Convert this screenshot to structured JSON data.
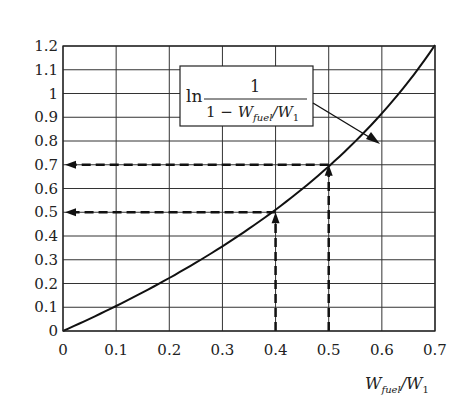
{
  "chart_data": {
    "type": "line",
    "title": "",
    "xlabel": "W_fuel/W_1",
    "xlabel_parts": {
      "main1": "W",
      "sub1": "fuel",
      "slash": "/",
      "main2": "W",
      "sub2": "1"
    },
    "ylabel": "",
    "xlim": [
      0,
      0.7
    ],
    "ylim": [
      0,
      1.2
    ],
    "grid": true,
    "x_ticks": [
      "0",
      "0.1",
      "0.2",
      "0.3",
      "0.4",
      "0.5",
      "0.6",
      "0.7"
    ],
    "y_ticks": [
      "0",
      "0.1",
      "0.2",
      "0.3",
      "0.4",
      "0.5",
      "0.6",
      "0.7",
      "0.8",
      "0.9",
      "1",
      "1.1",
      "1.2"
    ],
    "series": [
      {
        "name": "ln 1/(1 - W_fuel/W_1)",
        "x": [
          0,
          0.1,
          0.2,
          0.3,
          0.4,
          0.5,
          0.6,
          0.7
        ],
        "values": [
          0,
          0.105,
          0.223,
          0.357,
          0.511,
          0.693,
          0.916,
          1.204
        ]
      }
    ],
    "annotations": [
      {
        "type": "dashed-arrow",
        "from_x": 0.4,
        "to_y": 0.5,
        "label": "W_fuel/W_1 = 0.4 → 0.5"
      },
      {
        "type": "dashed-arrow",
        "from_x": 0.5,
        "to_y": 0.7,
        "label": "W_fuel/W_1 = 0.5 → 0.7"
      }
    ],
    "legend": {
      "ln": "ln",
      "numerator": "1",
      "denominator_prefix": "1 − ",
      "w": "W",
      "sub_fuel": "fuel",
      "slash": "/",
      "w1": "W",
      "sub_1": "1"
    }
  }
}
